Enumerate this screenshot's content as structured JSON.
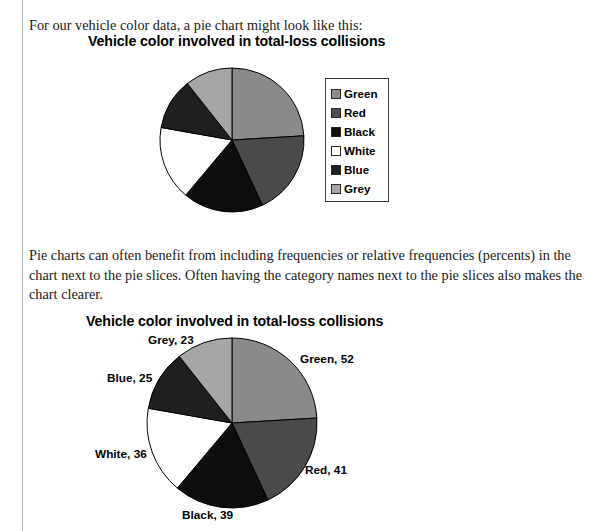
{
  "page": {
    "cropped_top_fragment": "p",
    "intro_paragraph": "For our vehicle color data, a pie chart might look like this:",
    "middle_paragraph": "Pie charts can often benefit from including frequencies or relative frequencies (percents) in the chart next to the pie slices.  Often having the category names next to the pie slices also makes the chart clearer."
  },
  "chart_data": [
    {
      "id": "pie-with-legend",
      "type": "pie",
      "title": "Vehicle color involved in total-loss collisions",
      "categories": [
        "Green",
        "Red",
        "Black",
        "White",
        "Blue",
        "Grey"
      ],
      "values": [
        52,
        41,
        39,
        36,
        25,
        23
      ],
      "total": 216,
      "colors": [
        "#8a8a8a",
        "#4a4a4a",
        "#0d0d0d",
        "#ffffff",
        "#1f1f1f",
        "#a6a6a6"
      ],
      "legend": {
        "position": "right",
        "entries": [
          {
            "label": "Green",
            "color": "#8a8a8a"
          },
          {
            "label": "Red",
            "color": "#4a4a4a"
          },
          {
            "label": "Black",
            "color": "#0d0d0d"
          },
          {
            "label": "White",
            "color": "#ffffff"
          },
          {
            "label": "Blue",
            "color": "#1f1f1f"
          },
          {
            "label": "Grey",
            "color": "#a6a6a6"
          }
        ]
      },
      "start_angle_deg": 0,
      "direction": "clockwise",
      "data_labels": false
    },
    {
      "id": "pie-with-data-labels",
      "type": "pie",
      "title": "Vehicle color involved in total-loss collisions",
      "categories": [
        "Green",
        "Red",
        "Black",
        "White",
        "Blue",
        "Grey"
      ],
      "values": [
        52,
        41,
        39,
        36,
        25,
        23
      ],
      "total": 216,
      "colors": [
        "#8a8a8a",
        "#4a4a4a",
        "#0d0d0d",
        "#ffffff",
        "#1f1f1f",
        "#a6a6a6"
      ],
      "legend": {
        "position": "none",
        "entries": []
      },
      "start_angle_deg": 0,
      "direction": "clockwise",
      "data_labels": true,
      "annotations": [
        {
          "text": "Green, 52",
          "x": 300,
          "y": 352
        },
        {
          "text": "Red, 41",
          "x": 305,
          "y": 463
        },
        {
          "text": "Black, 39",
          "x": 182,
          "y": 508
        },
        {
          "text": "White, 36",
          "x": 95,
          "y": 447
        },
        {
          "text": "Blue, 25",
          "x": 107,
          "y": 371
        },
        {
          "text": "Grey, 23",
          "x": 148,
          "y": 333
        }
      ]
    }
  ]
}
